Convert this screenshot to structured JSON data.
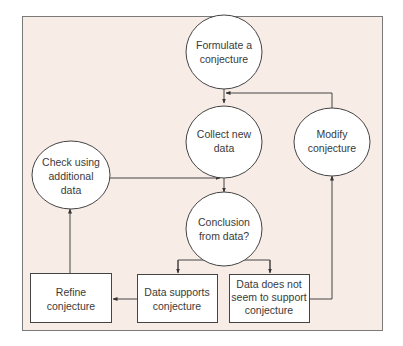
{
  "diagram": {
    "colors": {
      "panel_bg": "#f8ece7",
      "panel_border": "#7a7a7a",
      "node_fill": "#ffffff",
      "stroke": "#444444",
      "text": "#3a3a3a"
    },
    "nodes": {
      "formulate": {
        "shape": "ellipse",
        "lines": [
          "Formulate a",
          "conjecture"
        ]
      },
      "collect": {
        "shape": "ellipse",
        "lines": [
          "Collect new",
          "data"
        ]
      },
      "modify": {
        "shape": "ellipse",
        "lines": [
          "Modify",
          "conjecture"
        ]
      },
      "check": {
        "shape": "ellipse",
        "lines": [
          "Check using",
          "additional",
          "data"
        ]
      },
      "conclusion": {
        "shape": "ellipse",
        "lines": [
          "Conclusion",
          "from data?"
        ]
      },
      "refine": {
        "shape": "box",
        "lines": [
          "Refine",
          "conjecture"
        ]
      },
      "supports": {
        "shape": "box",
        "lines": [
          "Data supports",
          "conjecture"
        ]
      },
      "not_support": {
        "shape": "box",
        "lines": [
          "Data does not",
          "seem to support",
          "conjecture"
        ]
      }
    },
    "edges": [
      {
        "from": "formulate",
        "to": "collect"
      },
      {
        "from": "collect",
        "to": "conclusion"
      },
      {
        "from": "conclusion",
        "to": "supports"
      },
      {
        "from": "conclusion",
        "to": "not_support"
      },
      {
        "from": "supports",
        "to": "refine"
      },
      {
        "from": "refine",
        "to": "check"
      },
      {
        "from": "check",
        "to": "conclusion"
      },
      {
        "from": "not_support",
        "to": "modify"
      },
      {
        "from": "modify",
        "to": "collect"
      }
    ]
  }
}
